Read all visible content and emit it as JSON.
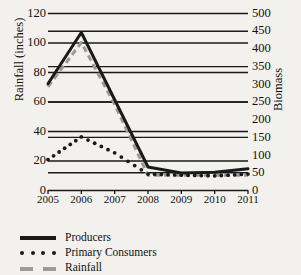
{
  "chart_data": {
    "type": "line",
    "title": "",
    "xlabel": "",
    "ylabel": "Rainfall (inches)",
    "ylabel_secondary": "Biomass",
    "x": [
      2005,
      2006,
      2007,
      2008,
      2009,
      2010,
      2011
    ],
    "categories": [
      "2005",
      "2006",
      "2007",
      "2008",
      "2009",
      "2010",
      "2011"
    ],
    "xlim": [
      2005,
      2011
    ],
    "ylim": [
      0,
      120
    ],
    "ylim_secondary": [
      0,
      500
    ],
    "yticks": [
      0,
      20,
      40,
      60,
      80,
      100,
      120
    ],
    "yticks_secondary": [
      0,
      50,
      100,
      150,
      200,
      250,
      300,
      350,
      400,
      450,
      500
    ],
    "grid": true,
    "grid_axis": "y",
    "legend_position": "below",
    "series": [
      {
        "name": "Producers",
        "axis": "secondary",
        "style": "solid",
        "color": "#1a1a1a",
        "values": [
          300,
          445,
          255,
          65,
          48,
          50,
          60
        ],
        "values_left_scale": [
          72,
          107,
          61,
          16,
          11.5,
          12,
          14
        ]
      },
      {
        "name": "Primary Consumers",
        "axis": "secondary",
        "style": "dotted",
        "color": "#1a1a1a",
        "values": [
          86,
          150,
          105,
          45,
          42,
          40,
          45
        ],
        "values_left_scale": [
          21,
          36,
          25,
          11,
          10,
          9.5,
          11
        ]
      },
      {
        "name": "Rainfall",
        "axis": "primary",
        "style": "dashed",
        "color": "#9a9a9a",
        "values": [
          70,
          100,
          58,
          10,
          10,
          10,
          10
        ]
      }
    ]
  },
  "axes": {
    "left_title": "Rainfall (inches)",
    "right_title": "Biomass",
    "left_ticks": [
      "120",
      "100",
      "80",
      "60",
      "40",
      "20",
      "0"
    ],
    "right_ticks": [
      "500",
      "450",
      "400",
      "350",
      "300",
      "250",
      "200",
      "150",
      "100",
      "50",
      "0"
    ],
    "x_ticks": [
      "2005",
      "2006",
      "2007",
      "2008",
      "2009",
      "2010",
      "2011"
    ]
  },
  "legend": {
    "items": [
      {
        "label": "Producers",
        "marker": "solid-line",
        "color": "#1a1a1a"
      },
      {
        "label": "Primary Consumers",
        "marker": "dotted-line",
        "color": "#1a1a1a"
      },
      {
        "label": "Rainfall",
        "marker": "dashed-line",
        "color": "#9a9a9a"
      }
    ]
  },
  "colors": {
    "background": "#f2f1ee",
    "axis": "#1a1a1a",
    "grid": "#1a1a1a",
    "rainfall": "#9a9a9a"
  }
}
